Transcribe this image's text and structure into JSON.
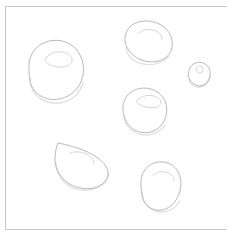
{
  "canvas": {
    "width": 227,
    "height": 239,
    "background_color": "#ffffff",
    "title": "Water droplets line drawing"
  },
  "frame": {
    "name": "picture-frame-border",
    "stroke_color": "#c9c9c9",
    "stroke_width": 1,
    "x": 5.5,
    "y": 6.5,
    "width": 226,
    "height": 223
  },
  "style": {
    "outline_color": "#b9b9b9",
    "shadow_color": "#e2e2e2",
    "highlight_color": "#d6d6d6",
    "outline_width": 1,
    "shadow_width": 1.4,
    "highlight_width": 1
  },
  "droplets": [
    {
      "id": "droplet-large-left",
      "label": "Large rounded droplet, upper left",
      "outline_path": "M 29.0 70.5 C 27.5 58.5 33.5 47.0 44.5 42.5 C 55.5 38.0 68.5 40.5 76.0 49.0 C 83.5 57.5 85.5 70.0 81.5 80.5 C 77.5 91.0 67.5 98.5 56.5 99.5 C 45.5 100.5 35.0 94.5 31.0 85.0 C 29.4 81.1 29.2 75.5 29.0 70.5 Z",
      "shadow_path": "M 30.5 78.0 C 29.5 88.0 35.5 97.0 45.0 101.0 C 54.5 105.0 66.0 103.5 74.0 97.0 C 78.5 93.3 81.5 88.0 83.0 82.5",
      "highlight_path": "M 46.0 58.0 C 49.0 53.5 56.0 51.0 62.5 52.0 C 69.0 53.0 73.0 57.0 72.0 61.0 C 71.0 65.0 65.0 67.5 58.5 67.0 C 52.0 66.5 46.5 63.5 45.5 60.5 C 45.1 59.6 45.4 58.9 46.0 58.0 Z",
      "highlight_shape": "elongated-oval"
    },
    {
      "id": "droplet-top-right",
      "label": "Oval droplet, top right",
      "outline_path": "M 125.0 41.0 C 124.0 31.5 130.5 23.5 140.5 21.5 C 150.5 19.5 161.5 23.0 167.5 30.5 C 173.5 38.0 174.0 48.5 168.5 55.0 C 163.0 61.5 152.0 63.5 143.0 60.5 C 134.0 57.5 126.5 50.5 125.0 41.0 Z",
      "shadow_path": "M 126.0 47.0 C 126.5 55.5 133.5 62.0 143.0 64.0 C 152.5 66.0 163.0 63.0 168.5 56.5",
      "highlight_path": "M 138.5 33.5 C 142.0 29.5 149.5 28.5 155.5 31.0 C 160.0 32.9 162.5 36.3 162.0 39.5",
      "highlight_shape": "crescent-arc"
    },
    {
      "id": "droplet-small-right",
      "label": "Small droplet, right side",
      "outline_path": "M 188.5 76.0 C 187.5 69.5 191.5 63.5 197.5 62.5 C 203.5 61.5 209.0 65.5 210.0 71.5 C 211.0 77.5 207.5 84.0 202.0 85.5 C 196.5 87.0 190.5 83.5 188.5 76.0 Z",
      "shadow_path": "M 189.0 79.0 C 190.0 84.5 195.0 88.0 200.5 87.0 C 205.5 86.1 209.5 82.0 210.2 77.0",
      "highlight_path": "M 196.0 69.5 C 196.0 67.5 197.6 66.0 199.6 66.0 C 201.6 66.0 203.2 67.5 203.2 69.5 C 203.2 71.5 201.6 73.0 199.6 73.0 C 197.6 73.0 196.0 71.5 196.0 69.5 Z",
      "highlight_shape": "small-circle"
    },
    {
      "id": "droplet-center",
      "label": "Rounded droplet, center",
      "outline_path": "M 123.0 110.0 C 122.0 99.5 129.0 90.5 139.5 88.5 C 150.0 86.5 161.0 91.5 165.0 101.0 C 169.0 110.5 166.0 122.5 158.0 128.5 C 150.0 134.5 138.5 134.0 131.0 127.5 C 125.6 122.8 123.5 116.0 123.0 110.0 Z",
      "shadow_path": "M 124.0 116.0 C 124.5 125.0 131.5 132.5 141.0 134.5 C 150.5 136.5 160.5 132.5 165.5 124.5",
      "highlight_path": "M 137.5 100.0 C 140.5 96.0 147.5 94.5 153.5 96.0 C 159.5 97.5 162.5 101.5 160.5 104.5 C 158.5 107.5 152.0 108.5 146.0 107.0 C 140.0 105.5 136.0 102.5 136.5 101.0 C 136.7 100.6 137.1 100.3 137.5 100.0 Z",
      "highlight_shape": "elongated-oval"
    },
    {
      "id": "droplet-teardrop-left",
      "label": "Teardrop shape with tail, lower left",
      "outline_path": "M 58.0 143.0 C 66.0 144.5 78.0 147.5 88.5 152.5 C 99.0 157.5 107.0 164.5 108.0 172.0 C 109.0 179.5 102.5 186.0 93.5 188.0 C 84.5 190.0 73.5 187.5 66.0 181.5 C 58.5 175.5 54.5 166.5 55.0 157.5 C 55.3 152.0 56.3 147.0 58.0 143.0 Z",
      "shadow_path": "M 56.0 163.0 C 56.5 173.5 62.5 183.0 72.0 187.5 C 81.5 192.0 93.5 191.0 101.5 185.0 C 105.5 182.0 108.0 177.8 108.8 173.5",
      "highlight_path": "M 69.5 153.5 C 74.0 150.5 82.5 151.5 88.5 155.5 C 92.5 158.2 94.5 161.5 93.5 163.5",
      "highlight_shape": "crescent-arc"
    },
    {
      "id": "droplet-bottom-right",
      "label": "Tall oval droplet, bottom right",
      "outline_path": "M 141.0 185.0 C 140.0 173.0 147.0 163.5 158.0 162.0 C 169.0 160.5 178.5 167.5 180.5 178.5 C 182.5 189.5 177.5 202.0 168.5 207.5 C 159.5 213.0 148.5 210.0 144.0 201.5 C 141.6 196.9 141.2 190.5 141.0 185.0 Z",
      "shadow_path": "M 142.0 192.0 C 142.5 201.5 148.5 209.5 157.5 211.5 C 166.5 213.5 176.0 209.0 180.0 200.5",
      "highlight_path": "M 153.0 175.5 C 156.0 171.5 163.0 170.5 168.5 173.0 C 172.5 174.8 174.5 177.8 174.0 180.5",
      "highlight_shape": "crescent-arc"
    }
  ]
}
